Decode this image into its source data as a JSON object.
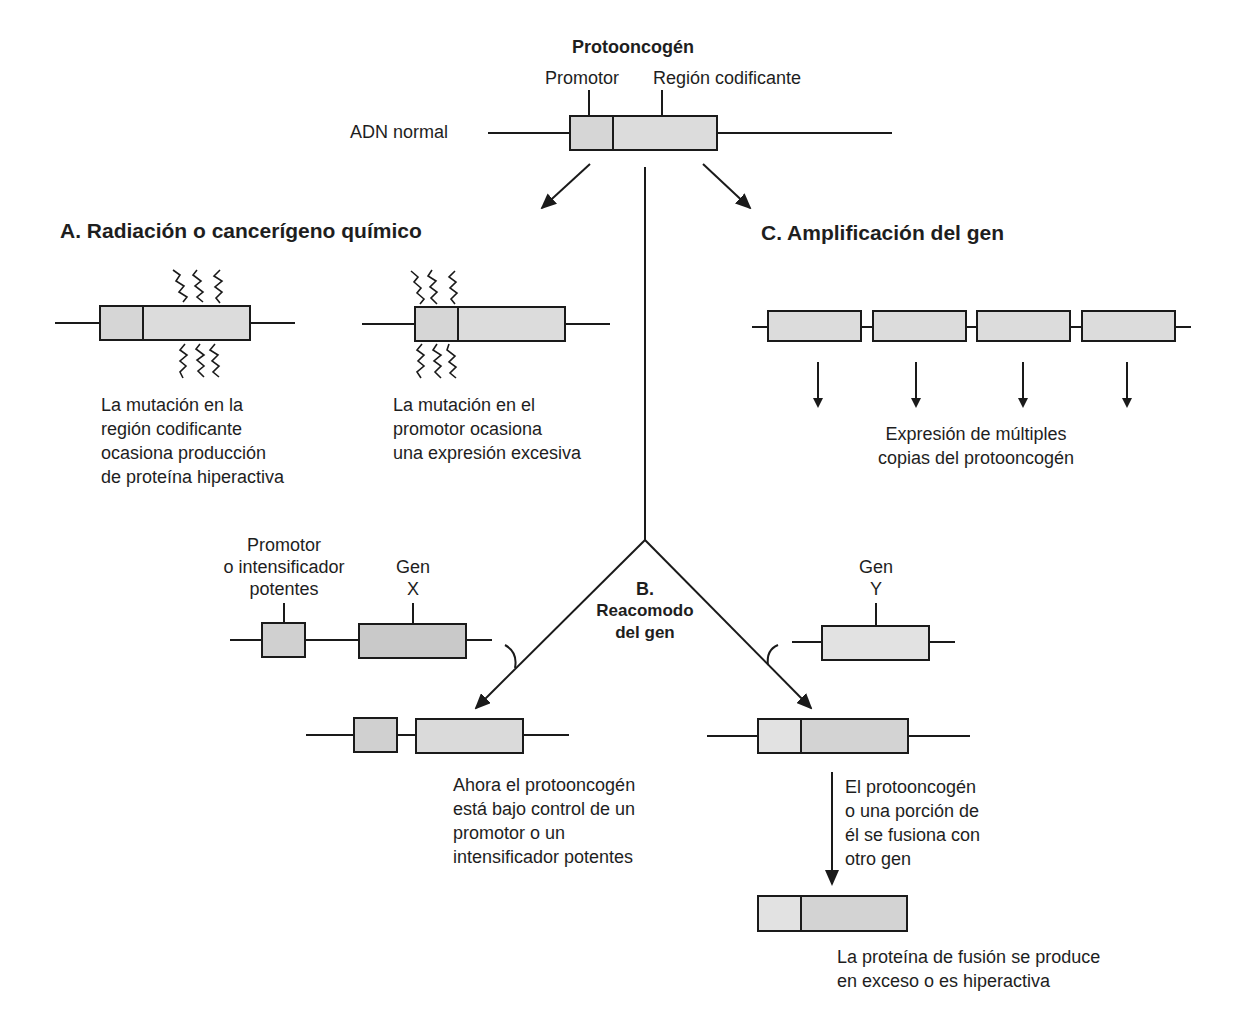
{
  "title": "Protooncogén",
  "top": {
    "label_promoter": "Promotor",
    "label_coding": "Región codificante",
    "label_dna": "ADN normal"
  },
  "section_a": {
    "heading": "A. Radiación o cancerígeno químico",
    "caption_left": [
      "La mutación en la",
      "región codificante",
      "ocasiona producción",
      "de proteína hiperactiva"
    ],
    "caption_right": [
      "La mutación en el",
      "promotor ocasiona",
      "una expresión excesiva"
    ]
  },
  "section_b": {
    "heading_letter": "B.",
    "heading_text": [
      "Reacomodo",
      "del gen"
    ],
    "label_promoter_strong": [
      "Promotor",
      "o intensificador",
      "potentes"
    ],
    "label_gene_x": [
      "Gen",
      "X"
    ],
    "label_gene_y": [
      "Gen",
      "Y"
    ],
    "caption_left": [
      "Ahora el protooncogén",
      "está bajo control de un",
      "promotor o un",
      "intensificador potentes"
    ],
    "caption_right_arrow": [
      "El protooncogén",
      "o una porción de",
      "él se fusiona con",
      "otro gen"
    ],
    "caption_fusion": [
      "La proteína de fusión se produce",
      "en exceso o es hiperactiva"
    ]
  },
  "section_c": {
    "heading": "C. Amplificación del gen",
    "caption": [
      "Expresión de múltiples",
      "copias del protooncogén"
    ],
    "copies": 4
  },
  "colors": {
    "box_fill": "#d9d9d9",
    "box_fill_dark": "#c8c8c8",
    "box_fill_light": "#e3e3e3",
    "stroke": "#1a1a1a"
  }
}
